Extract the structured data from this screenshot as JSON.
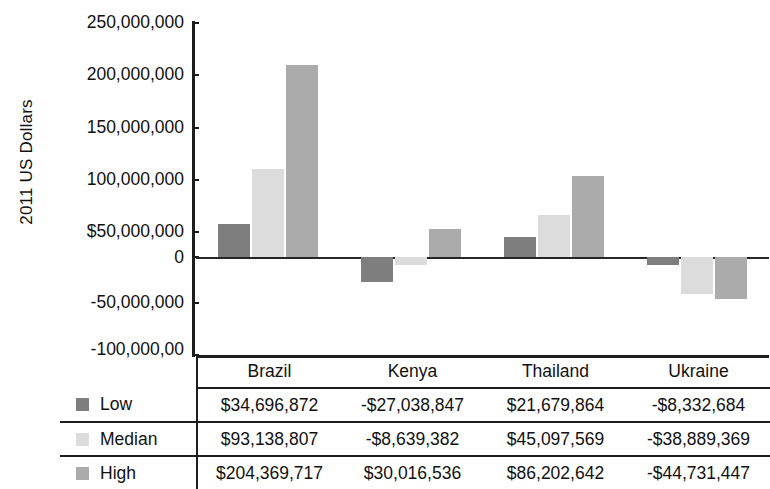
{
  "chart_data": {
    "type": "bar",
    "title": "",
    "subtitle": "",
    "xlabel": "",
    "ylabel": "2011 US Dollars",
    "categories": [
      "Brazil",
      "Kenya",
      "Thailand",
      "Ukraine"
    ],
    "series": [
      {
        "name": "Low",
        "color": "#7e7e7e",
        "values": [
          34696872,
          -27038847,
          21679864,
          -8332684
        ],
        "labels": [
          "$34,696,872",
          "-$27,038,847",
          "$21,679,864",
          "-$8,332,684"
        ]
      },
      {
        "name": "Median",
        "color": "#dcdcdc",
        "values": [
          93138807,
          -8639382,
          45097569,
          -38889369
        ],
        "labels": [
          "$93,138,807",
          "-$8,639,382",
          "$45,097,569",
          "-$38,889,369"
        ]
      },
      {
        "name": "High",
        "color": "#ababab",
        "values": [
          204369717,
          30016536,
          86202642,
          -44731447
        ],
        "labels": [
          "$204,369,717",
          "$30,016,536",
          "$86,202,642",
          "-$44,731,447"
        ]
      }
    ],
    "ylim": [
      -100000000,
      250000000
    ],
    "ytick_values": [
      250000000,
      200000000,
      150000000,
      100000000,
      50000000,
      0,
      -50000000,
      -100000000
    ],
    "ytick_labels": [
      "250,000,000",
      "200,000,000",
      "150,000,000",
      "100,000,000",
      "$50,000,000",
      "0",
      "-50,000,000",
      "-100,000,00"
    ],
    "grid": false,
    "legend_position": "table-left-column",
    "zero_line": true
  },
  "table": {
    "header": [
      "",
      "Brazil",
      "Kenya",
      "Thailand",
      "Ukraine"
    ],
    "rows": [
      {
        "label": "Low",
        "swatch": "low-swatch",
        "cells": [
          "$34,696,872",
          "-$27,038,847",
          "$21,679,864",
          "-$8,332,684"
        ]
      },
      {
        "label": "Median",
        "swatch": "median-swatch",
        "cells": [
          "$93,138,807",
          "-$8,639,382",
          "$45,097,569",
          "-$38,889,369"
        ]
      },
      {
        "label": "High",
        "swatch": "high-swatch",
        "cells": [
          "$204,369,717",
          "$30,016,536",
          "$86,202,642",
          "-$44,731,447"
        ]
      }
    ]
  },
  "colors": {
    "low": "#7e7e7e",
    "median": "#dcdcdc",
    "high": "#ababab",
    "axis": "#1d1d1d",
    "background": "#ffffff"
  }
}
